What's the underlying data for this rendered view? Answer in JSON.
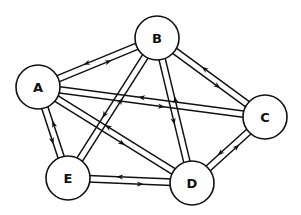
{
  "diagram": {
    "type": "directed graph (bidirectional edges)",
    "stroke_color": "#111111",
    "background": "#ffffff",
    "nodes": [
      {
        "id": "A",
        "label": "A",
        "x": 38,
        "y": 87,
        "r": 22
      },
      {
        "id": "B",
        "label": "B",
        "x": 157,
        "y": 38,
        "r": 22
      },
      {
        "id": "C",
        "label": "C",
        "x": 265,
        "y": 117,
        "r": 22
      },
      {
        "id": "D",
        "label": "D",
        "x": 192,
        "y": 183,
        "r": 22
      },
      {
        "id": "E",
        "label": "E",
        "x": 68,
        "y": 178,
        "r": 22
      }
    ],
    "edges": [
      {
        "from": "A",
        "to": "B",
        "bidirectional": true
      },
      {
        "from": "A",
        "to": "C",
        "bidirectional": true
      },
      {
        "from": "A",
        "to": "D",
        "bidirectional": true
      },
      {
        "from": "A",
        "to": "E",
        "bidirectional": true
      },
      {
        "from": "B",
        "to": "C",
        "bidirectional": true
      },
      {
        "from": "B",
        "to": "D",
        "bidirectional": true
      },
      {
        "from": "B",
        "to": "E",
        "bidirectional": true
      },
      {
        "from": "C",
        "to": "D",
        "bidirectional": true
      },
      {
        "from": "D",
        "to": "E",
        "bidirectional": true
      }
    ]
  }
}
